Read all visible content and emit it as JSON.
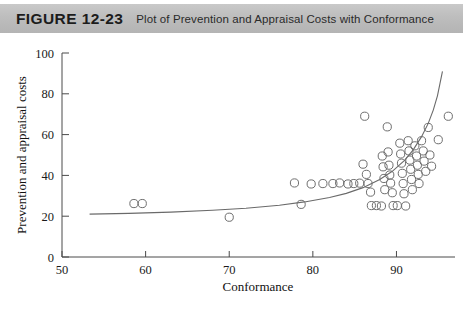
{
  "header": {
    "figure_label": "FIGURE 12-23",
    "caption": "Plot of Prevention and Appraisal Costs with Conformance",
    "band_color": "#bdbdbd"
  },
  "chart_data": {
    "type": "scatter",
    "title": "Plot of Prevention and Appraisal Costs with Conformance",
    "xlabel": "Conformance",
    "ylabel": "Prevention and appraisal costs",
    "xlim": [
      50,
      97
    ],
    "ylim": [
      0,
      100
    ],
    "xticks": [
      50,
      60,
      70,
      80,
      90
    ],
    "yticks": [
      0,
      20,
      40,
      60,
      80,
      100
    ],
    "grid": false,
    "legend": null,
    "marker_style": "open-circle",
    "marker_color": "#6e6e6e",
    "points": [
      [
        58.6,
        26.2
      ],
      [
        59.6,
        26.2
      ],
      [
        70.0,
        19.5
      ],
      [
        77.8,
        36.3
      ],
      [
        78.6,
        25.8
      ],
      [
        79.8,
        35.8
      ],
      [
        81.2,
        36.0
      ],
      [
        82.4,
        36.0
      ],
      [
        83.2,
        36.3
      ],
      [
        84.2,
        35.8
      ],
      [
        84.9,
        36.0
      ],
      [
        85.6,
        36.2
      ],
      [
        86.2,
        69.0
      ],
      [
        86.0,
        45.5
      ],
      [
        86.4,
        40.5
      ],
      [
        86.6,
        36.0
      ],
      [
        86.9,
        31.8
      ],
      [
        87.0,
        25.2
      ],
      [
        87.6,
        25.2
      ],
      [
        88.2,
        25.0
      ],
      [
        88.3,
        49.5
      ],
      [
        88.4,
        44.2
      ],
      [
        88.5,
        38.5
      ],
      [
        88.6,
        33.0
      ],
      [
        88.9,
        63.8
      ],
      [
        89.0,
        51.5
      ],
      [
        89.1,
        45.0
      ],
      [
        89.2,
        40.2
      ],
      [
        89.3,
        36.2
      ],
      [
        89.5,
        31.5
      ],
      [
        89.6,
        25.2
      ],
      [
        90.1,
        25.2
      ],
      [
        90.4,
        55.8
      ],
      [
        90.5,
        50.5
      ],
      [
        90.6,
        46.0
      ],
      [
        90.7,
        41.0
      ],
      [
        90.8,
        36.0
      ],
      [
        90.9,
        31.0
      ],
      [
        91.1,
        25.0
      ],
      [
        91.4,
        57.0
      ],
      [
        91.5,
        52.0
      ],
      [
        91.6,
        47.5
      ],
      [
        91.7,
        43.0
      ],
      [
        91.8,
        38.0
      ],
      [
        91.9,
        33.0
      ],
      [
        92.2,
        54.5
      ],
      [
        92.4,
        49.5
      ],
      [
        92.5,
        45.0
      ],
      [
        92.6,
        40.5
      ],
      [
        92.7,
        36.0
      ],
      [
        93.0,
        57.0
      ],
      [
        93.2,
        52.0
      ],
      [
        93.3,
        47.0
      ],
      [
        93.5,
        42.0
      ],
      [
        93.8,
        63.5
      ],
      [
        94.0,
        50.0
      ],
      [
        94.2,
        44.5
      ],
      [
        95.0,
        57.5
      ],
      [
        96.2,
        69.0
      ]
    ],
    "fit_curve": {
      "description": "exponential fitted trend line",
      "color": "#6a6a6a",
      "points": [
        [
          53.3,
          21.0
        ],
        [
          58.0,
          21.4
        ],
        [
          63.0,
          22.0
        ],
        [
          68.0,
          22.9
        ],
        [
          72.0,
          23.9
        ],
        [
          76.0,
          25.4
        ],
        [
          79.0,
          27.0
        ],
        [
          82.0,
          29.2
        ],
        [
          84.0,
          31.2
        ],
        [
          86.0,
          34.0
        ],
        [
          88.0,
          38.0
        ],
        [
          89.5,
          42.0
        ],
        [
          91.0,
          47.5
        ],
        [
          92.0,
          52.5
        ],
        [
          93.0,
          59.0
        ],
        [
          93.8,
          65.5
        ],
        [
          94.4,
          72.0
        ],
        [
          94.9,
          79.0
        ],
        [
          95.2,
          85.0
        ],
        [
          95.5,
          91.0
        ]
      ]
    }
  }
}
